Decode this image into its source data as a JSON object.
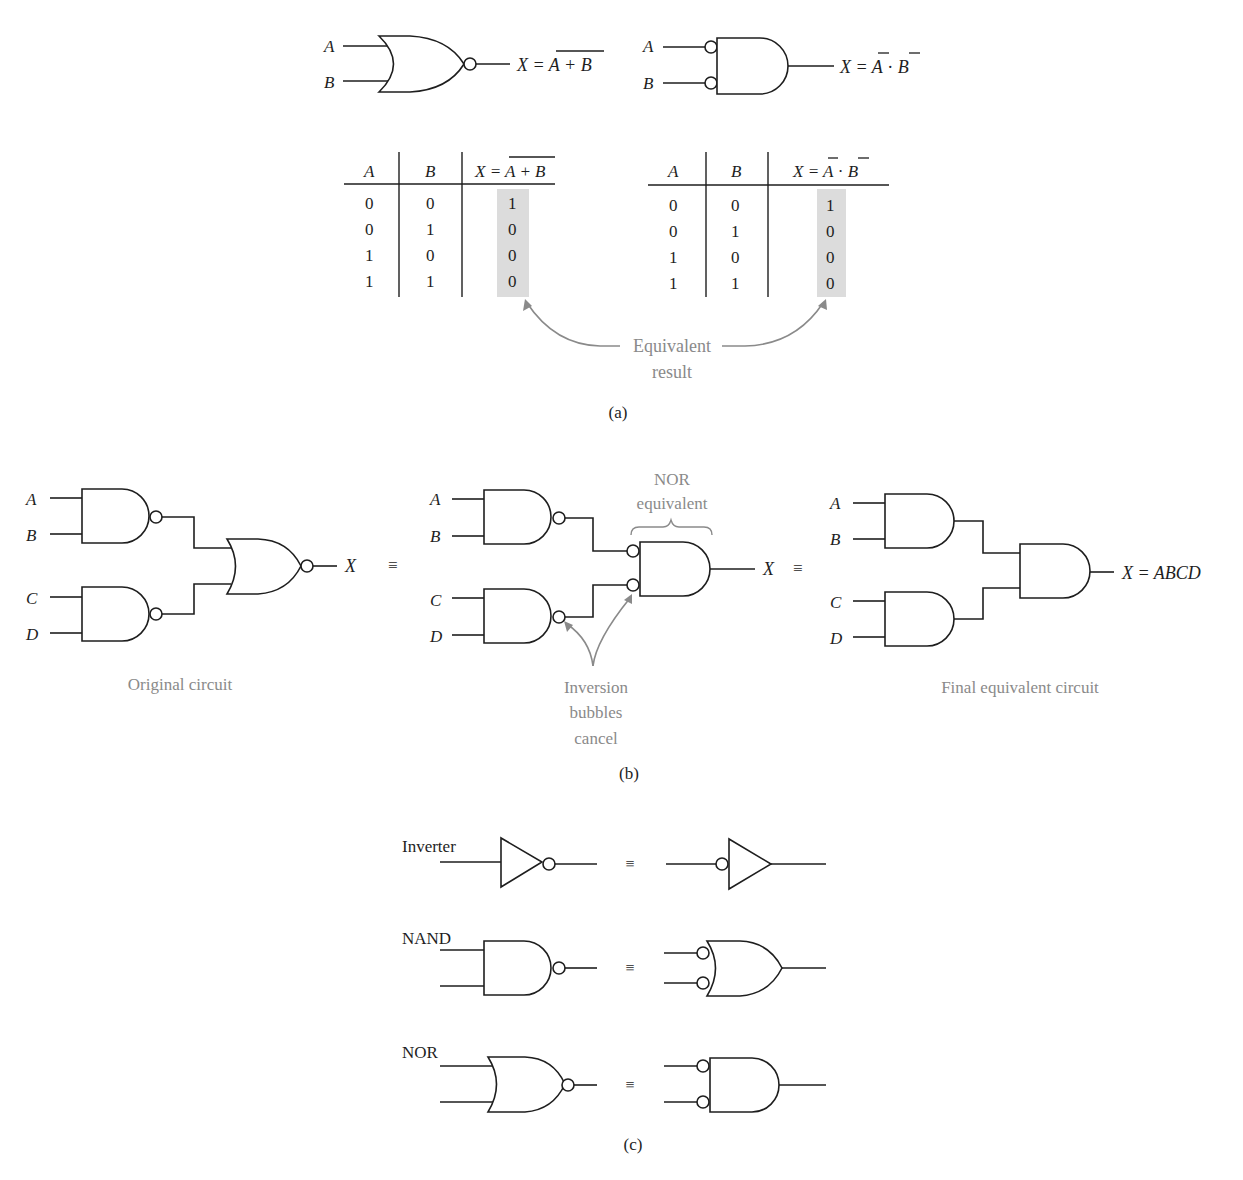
{
  "panel_a": {
    "caption": "(a)",
    "nor_gate": {
      "inputs": [
        "A",
        "B"
      ],
      "expression_lhs": "X = ",
      "expression_overbar": "A + B"
    },
    "negative_and_gate": {
      "inputs": [
        "A",
        "B"
      ],
      "expression_lhs": "X = ",
      "expression_a": "A",
      "expression_dot": " · ",
      "expression_b": "B"
    },
    "truth_table_nor": {
      "headers": [
        "A",
        "B",
        "X = A + B"
      ],
      "header_x_lhs": "X = ",
      "header_x_overbar": "A + B",
      "rows": [
        [
          "0",
          "0",
          "1"
        ],
        [
          "0",
          "1",
          "0"
        ],
        [
          "1",
          "0",
          "0"
        ],
        [
          "1",
          "1",
          "0"
        ]
      ]
    },
    "truth_table_neg_and": {
      "headers": [
        "A",
        "B",
        "X = Ā · B̄"
      ],
      "header_x_lhs": "X = ",
      "header_x_a": "A",
      "header_x_dot": " · ",
      "header_x_b": "B",
      "rows": [
        [
          "0",
          "0",
          "1"
        ],
        [
          "0",
          "1",
          "0"
        ],
        [
          "1",
          "0",
          "0"
        ],
        [
          "1",
          "1",
          "0"
        ]
      ]
    },
    "annotation_line1": "Equivalent",
    "annotation_line2": "result"
  },
  "panel_b": {
    "caption": "(b)",
    "equiv_symbol": "≡",
    "original": {
      "inputs": [
        "A",
        "B",
        "C",
        "D"
      ],
      "output": "X",
      "label": "Original circuit"
    },
    "intermediate": {
      "inputs": [
        "A",
        "B",
        "C",
        "D"
      ],
      "output": "X",
      "brace_label_line1": "NOR",
      "brace_label_line2": "equivalent",
      "note_line1": "Inversion",
      "note_line2": "bubbles",
      "note_line3": "cancel"
    },
    "final": {
      "inputs": [
        "A",
        "B",
        "C",
        "D"
      ],
      "output": "X = ABCD",
      "label": "Final equivalent circuit"
    }
  },
  "panel_c": {
    "caption": "(c)",
    "equiv_symbol": "≡",
    "rows": [
      {
        "label": "Inverter"
      },
      {
        "label": "NAND"
      },
      {
        "label": "NOR"
      }
    ]
  },
  "colors": {
    "line": "#1e1e1e",
    "annotation": "#8a8a8a",
    "highlight": "#dcdcdc"
  }
}
